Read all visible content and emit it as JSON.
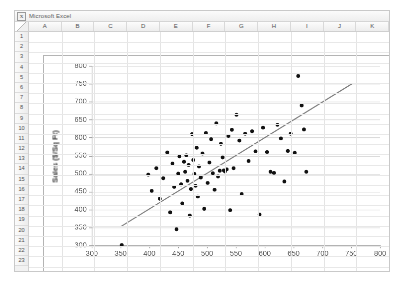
{
  "window": {
    "app_title": "Microsoft Excel",
    "logo_glyph": "X"
  },
  "spreadsheet": {
    "columns": [
      "A",
      "B",
      "C",
      "D",
      "E",
      "F",
      "G",
      "H",
      "I",
      "J",
      "K"
    ],
    "rows": [
      "1",
      "2",
      "3",
      "4",
      "5",
      "6",
      "7",
      "8",
      "9",
      "10",
      "11",
      "12",
      "13",
      "14",
      "15",
      "16",
      "17",
      "18",
      "19",
      "20",
      "21",
      "22",
      "23"
    ]
  },
  "colors": {
    "point_fill": "#111111",
    "trendline": "#808080",
    "gridline": "#d6d6d6",
    "axis_line": "#9a9a9a",
    "chart_background": "#ffffff",
    "axis_text": "#595959",
    "axis_title_text": "#3a3a3a"
  },
  "chart_data": {
    "type": "scatter",
    "title": "",
    "xlabel": "Estimated Sales ($/Sq Ft)",
    "ylabel": "Sales ($/Sq Ft)",
    "xlim": [
      300,
      800
    ],
    "ylim": [
      300,
      800
    ],
    "xticks": [
      300,
      350,
      400,
      450,
      500,
      550,
      600,
      650,
      700,
      750,
      800
    ],
    "yticks": [
      300,
      350,
      400,
      450,
      500,
      550,
      600,
      650,
      700,
      750,
      800
    ],
    "grid": "horizontal",
    "legend": "none",
    "series": [
      {
        "name": "Stores",
        "marker": "filled-circle",
        "points": [
          [
            352,
            301
          ],
          [
            398,
            497
          ],
          [
            404,
            452
          ],
          [
            412,
            515
          ],
          [
            418,
            430
          ],
          [
            424,
            487
          ],
          [
            431,
            559
          ],
          [
            436,
            392
          ],
          [
            440,
            528
          ],
          [
            443,
            463
          ],
          [
            447,
            345
          ],
          [
            450,
            500
          ],
          [
            452,
            548
          ],
          [
            455,
            470
          ],
          [
            457,
            417
          ],
          [
            460,
            533
          ],
          [
            462,
            505
          ],
          [
            464,
            551
          ],
          [
            466,
            480
          ],
          [
            468,
            524
          ],
          [
            470,
            383
          ],
          [
            472,
            457
          ],
          [
            474,
            610
          ],
          [
            476,
            538
          ],
          [
            478,
            499
          ],
          [
            480,
            466
          ],
          [
            482,
            572
          ],
          [
            484,
            436
          ],
          [
            486,
            520
          ],
          [
            489,
            489
          ],
          [
            492,
            556
          ],
          [
            495,
            402
          ],
          [
            498,
            613
          ],
          [
            501,
            474
          ],
          [
            504,
            531
          ],
          [
            507,
            596
          ],
          [
            510,
            501
          ],
          [
            513,
            455
          ],
          [
            516,
            640
          ],
          [
            519,
            492
          ],
          [
            522,
            508
          ],
          [
            524,
            583
          ],
          [
            527,
            545
          ],
          [
            529,
            509
          ],
          [
            531,
            506
          ],
          [
            534,
            512
          ],
          [
            537,
            605
          ],
          [
            540,
            398
          ],
          [
            543,
            622
          ],
          [
            546,
            515
          ],
          [
            551,
            664
          ],
          [
            556,
            592
          ],
          [
            560,
            443
          ],
          [
            566,
            611
          ],
          [
            572,
            535
          ],
          [
            578,
            618
          ],
          [
            584,
            562
          ],
          [
            591,
            386
          ],
          [
            597,
            628
          ],
          [
            604,
            560
          ],
          [
            610,
            505
          ],
          [
            616,
            502
          ],
          [
            622,
            636
          ],
          [
            628,
            598
          ],
          [
            634,
            478
          ],
          [
            640,
            563
          ],
          [
            645,
            611
          ],
          [
            652,
            558
          ],
          [
            658,
            772
          ],
          [
            664,
            690
          ],
          [
            668,
            623
          ],
          [
            672,
            505
          ]
        ]
      }
    ],
    "trendline": {
      "name": "Linear trend",
      "x0": 350,
      "y0": 352,
      "x1": 752,
      "y1": 751
    }
  }
}
